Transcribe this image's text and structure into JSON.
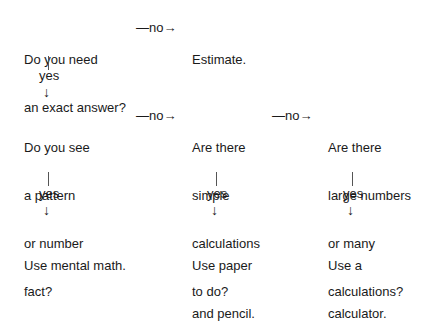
{
  "diagram": {
    "type": "decision-flowchart",
    "nodes": {
      "q_exact": {
        "lines": [
          "Do you need",
          "an exact answer?"
        ]
      },
      "estimate": {
        "lines": [
          "Estimate."
        ]
      },
      "q_pattern": {
        "lines": [
          "Do you see",
          "a pattern",
          "or number",
          "fact?"
        ]
      },
      "q_simple": {
        "lines": [
          "Are there",
          "simple",
          "calculations",
          "to do?"
        ]
      },
      "q_large": {
        "lines": [
          "Are there",
          "large numbers",
          "or many",
          "calculations?"
        ]
      },
      "mental": {
        "lines": [
          "Use mental math."
        ]
      },
      "paper": {
        "lines": [
          "Use paper",
          "and pencil."
        ]
      },
      "calculator": {
        "lines": [
          "Use a",
          "calculator."
        ]
      }
    },
    "edges": [
      {
        "from": "q_exact",
        "to": "estimate",
        "label": "—no→"
      },
      {
        "from": "q_exact",
        "to": "q_pattern",
        "label": "yes"
      },
      {
        "from": "q_pattern",
        "to": "q_simple",
        "label": "—no→"
      },
      {
        "from": "q_pattern",
        "to": "mental",
        "label": "yes"
      },
      {
        "from": "q_simple",
        "to": "q_large",
        "label": "—no→"
      },
      {
        "from": "q_simple",
        "to": "paper",
        "label": "yes"
      },
      {
        "from": "q_large",
        "to": "calculator",
        "label": "yes"
      }
    ],
    "labels": {
      "no_arrow": "—no→",
      "yes": "yes",
      "down_arrow": "↓"
    }
  }
}
